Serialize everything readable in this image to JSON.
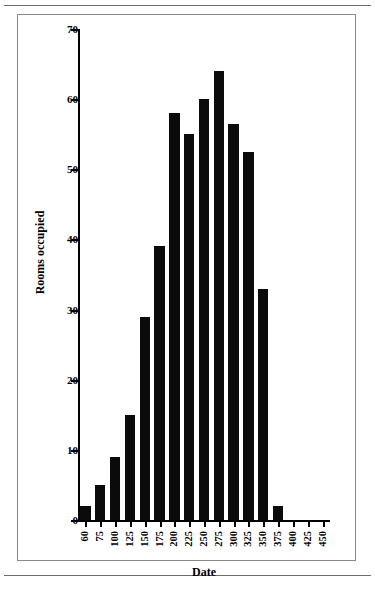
{
  "figure": {
    "frame_color": "#8a8a8a",
    "background": "#ffffff",
    "bar_color": "#0b0b0b"
  },
  "chart_data": {
    "type": "bar",
    "title": "",
    "xlabel": "Date",
    "ylabel": "Rooms occupied",
    "xlim": [
      60,
      450
    ],
    "ylim": [
      0,
      70
    ],
    "grid": false,
    "legend": null,
    "xticklabels": [
      "60",
      "75",
      "100",
      "125",
      "150",
      "175",
      "200",
      "225",
      "250",
      "275",
      "300",
      "325",
      "350",
      "375",
      "400",
      "425",
      "450"
    ],
    "yticklabels": [
      "0",
      "10",
      "20",
      "30",
      "40",
      "50",
      "60",
      "70"
    ],
    "xtickvalues": [
      60,
      75,
      100,
      125,
      150,
      175,
      200,
      225,
      250,
      275,
      300,
      325,
      350,
      375,
      400,
      425,
      450
    ],
    "ytickvalues": [
      0,
      10,
      20,
      30,
      40,
      50,
      60,
      70
    ],
    "categories": [
      "60",
      "75",
      "100",
      "125",
      "150",
      "175",
      "200",
      "225",
      "250",
      "275",
      "300",
      "325",
      "350",
      "375",
      "400",
      "425",
      "450"
    ],
    "values": [
      2,
      5,
      9,
      15,
      29,
      39,
      58,
      55,
      60,
      64,
      56.5,
      52.5,
      33,
      2,
      0,
      0,
      0
    ],
    "bars": [
      {
        "label": "60",
        "value": 2
      },
      {
        "label": "75",
        "value": 5
      },
      {
        "label": "100",
        "value": 9
      },
      {
        "label": "125",
        "value": 15
      },
      {
        "label": "150",
        "value": 29
      },
      {
        "label": "175",
        "value": 39
      },
      {
        "label": "200",
        "value": 58
      },
      {
        "label": "225",
        "value": 55
      },
      {
        "label": "250",
        "value": 60
      },
      {
        "label": "275",
        "value": 64
      },
      {
        "label": "300",
        "value": 56.5
      },
      {
        "label": "325",
        "value": 52.5
      },
      {
        "label": "350",
        "value": 33
      },
      {
        "label": "375",
        "value": 2
      },
      {
        "label": "400",
        "value": 0
      },
      {
        "label": "425",
        "value": 0
      },
      {
        "label": "450",
        "value": 0
      }
    ]
  }
}
